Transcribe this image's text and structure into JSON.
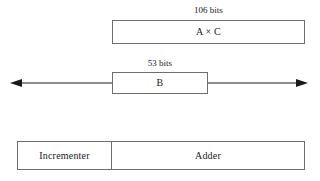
{
  "diagram": {
    "background_color": "#ffffff",
    "line_color": "#6e6e6e",
    "text_color": "#1a1a1a"
  },
  "product_row": {
    "width_caption": "106 bits",
    "box_label": "A × C"
  },
  "addend_row": {
    "width_caption": "53 bits",
    "box_label": "B",
    "arrow_icon": "double-headed-horizontal-arrow-icon"
  },
  "unit_row": {
    "cells": [
      {
        "label": "Incrementer"
      },
      {
        "label": "Adder"
      }
    ]
  }
}
